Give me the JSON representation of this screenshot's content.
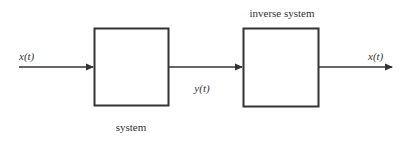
{
  "diagram": {
    "blocks": [
      {
        "id": "system",
        "label": "system"
      },
      {
        "id": "inverse",
        "label": "inverse system"
      }
    ],
    "signals": [
      {
        "id": "input",
        "label": "x(t)",
        "from": "external",
        "to": "system"
      },
      {
        "id": "intermediate",
        "label": "y(t)",
        "from": "system",
        "to": "inverse"
      },
      {
        "id": "output",
        "label": "x(t)",
        "from": "inverse",
        "to": "external"
      }
    ],
    "colors": {
      "stroke": "#333333",
      "text": "#333333",
      "background": "#ffffff"
    }
  }
}
